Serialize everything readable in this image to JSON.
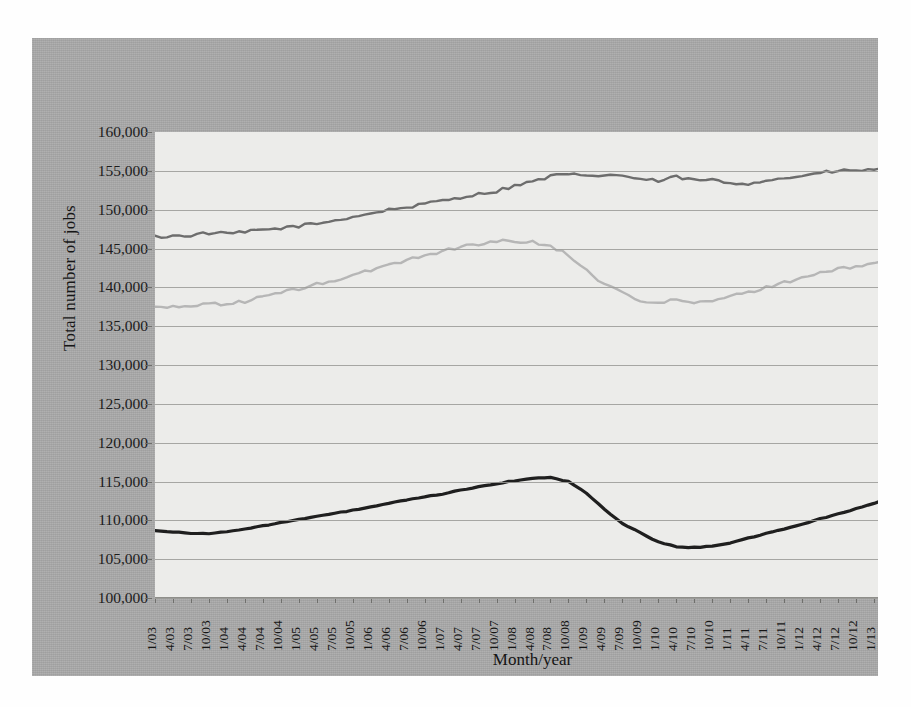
{
  "chart_data": {
    "type": "line",
    "title": "",
    "xlabel": "Month/year",
    "ylabel": "Total number of jobs",
    "ylim": [
      100000,
      160000
    ],
    "ytick_step": 5000,
    "grid": true,
    "legend_position": "bottom",
    "yticks": [
      "160,000",
      "155,000",
      "150,000",
      "145,000",
      "140,000",
      "135,000",
      "130,000",
      "125,000",
      "120,000",
      "115,000",
      "110,000",
      "105,000",
      "100,000"
    ],
    "categories": [
      "1/03",
      "4/03",
      "7/03",
      "10/03",
      "1/04",
      "4/04",
      "7/04",
      "10/04",
      "1/05",
      "4/05",
      "7/05",
      "10/05",
      "1/06",
      "4/06",
      "7/06",
      "10/06",
      "1/07",
      "4/07",
      "7/07",
      "10/07",
      "1/08",
      "4/08",
      "7/08",
      "10/08",
      "1/09",
      "4/09",
      "7/09",
      "10/09",
      "1/10",
      "4/10",
      "7/10",
      "10/10",
      "1/11",
      "4/11",
      "7/11",
      "10/11",
      "1/12",
      "4/12",
      "7/12",
      "10/12",
      "1/13",
      "4/13",
      "7/13"
    ],
    "series": [
      {
        "name": "U.S. labor force",
        "color": "#6d6d6d",
        "values": [
          146500,
          146600,
          146700,
          147000,
          146900,
          147100,
          147400,
          147600,
          147900,
          148200,
          148600,
          149100,
          149500,
          150000,
          150300,
          150700,
          151200,
          151600,
          152000,
          152400,
          153100,
          153600,
          154300,
          154600,
          154200,
          154500,
          154400,
          153900,
          153700,
          154200,
          153800,
          153800,
          153400,
          153400,
          153800,
          154000,
          154400,
          154700,
          155000,
          155000,
          155200,
          155400,
          155300
        ]
      },
      {
        "name": "Private sector U.S. jobs",
        "color": "#1f1f1f",
        "values": [
          108700,
          108500,
          108350,
          108300,
          108500,
          108900,
          109300,
          109700,
          110100,
          110500,
          110900,
          111300,
          111700,
          112200,
          112600,
          113000,
          113400,
          113900,
          114300,
          114700,
          115100,
          115400,
          115500,
          115000,
          113500,
          111400,
          109600,
          108400,
          107200,
          106600,
          106500,
          106700,
          107100,
          107700,
          108300,
          108900,
          109500,
          110200,
          110800,
          111500,
          112200,
          112900,
          113800
        ]
      },
      {
        "name": "Total U.S. employment",
        "color": "#b6b6b6",
        "values": [
          137500,
          137400,
          137600,
          138000,
          137800,
          138200,
          138800,
          139300,
          139800,
          140400,
          140900,
          141500,
          142200,
          142900,
          143500,
          144100,
          144700,
          145200,
          145600,
          145900,
          146000,
          145800,
          145300,
          144200,
          142200,
          140400,
          139300,
          138400,
          137900,
          138400,
          138000,
          138200,
          138800,
          139400,
          140000,
          140600,
          141300,
          141800,
          142300,
          142700,
          143100,
          143400,
          144000
        ]
      }
    ]
  },
  "legend": {
    "items": [
      {
        "label": "U.S. labor force",
        "color": "#6d6d6d"
      },
      {
        "label": "Private sector U.S. jobs",
        "color": "#1f1f1f"
      },
      {
        "label": "Total U.S. employment",
        "color": "#b6b6b6"
      }
    ]
  },
  "bleed_text": "text bleed from reverse page"
}
